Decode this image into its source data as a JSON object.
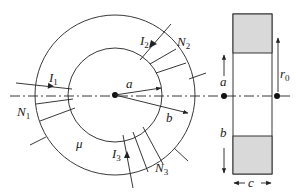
{
  "diagram": {
    "colors": {
      "line": "#222222",
      "core_section_fill": "#d9d9d9",
      "background": "#ffffff"
    },
    "labels": {
      "I1": {
        "main": "I",
        "sub": "1"
      },
      "I2": {
        "main": "I",
        "sub": "2"
      },
      "I3": {
        "main": "I",
        "sub": "3"
      },
      "N1": {
        "main": "N",
        "sub": "1"
      },
      "N2": {
        "main": "N",
        "sub": "2"
      },
      "N3": {
        "main": "N",
        "sub": "3"
      },
      "inner_radius": "a",
      "outer_radius": "b",
      "permeability": "μ",
      "section_a": "a",
      "section_b": "b",
      "section_width": "c",
      "mean_radius": {
        "main": "r",
        "sub": "0"
      }
    },
    "windings": [
      {
        "name": "N1",
        "current": "I1",
        "turns_drawn": 2
      },
      {
        "name": "N2",
        "current": "I2",
        "turns_drawn": 3
      },
      {
        "name": "N3",
        "current": "I3",
        "turns_drawn": 3
      }
    ]
  }
}
